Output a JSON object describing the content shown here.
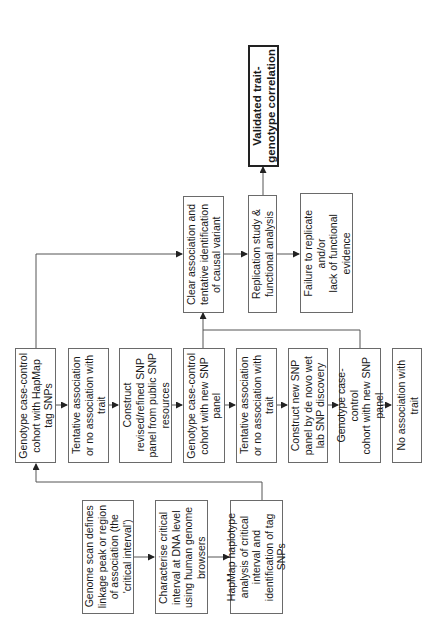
{
  "diagram": {
    "type": "flowchart",
    "orientation": "rotated-90-ccw",
    "colors": {
      "line": "#555555",
      "box_border": "#6a6a6a",
      "final_border": "#222222",
      "background": "#ffffff"
    },
    "nodes": {
      "genome_scan": "Genome scan defines\nlinkage peak or region\nof association (the\n'critical interval')",
      "characterise": "Characterise critical\ninterval at DNA level\nusing human genome\nbrowsers",
      "hapmap_analysis": "HapMap haplotype\nanalysis of critical\ninterval and\nidentification of tag\nSNPs",
      "genotype_hapmap": "Genotype case-control\ncohort with HapMap\ntag SNPs",
      "tentative_1": "Tentative association\nor no association with\ntrait",
      "construct_refined": "Construct\nrevised/refined SNP\npanel from public SNP\nresources",
      "genotype_new_1": "Genotype case-control\ncohort with new SNP\npanel",
      "tentative_2": "Tentative association\nor no association with\ntrait",
      "construct_denovo": "Construct new SNP\npanel by de novo wet\nlab SNP discovery",
      "genotype_new_2": "Genotype case-\ncontrol\ncohort with new SNP\npanel",
      "no_association": "No association with\ntrait",
      "clear_association": "Clear association and\ntentative identification\nof causal variant",
      "replication": "Replication study &\nfunctional analysis",
      "failure": "Failure to replicate\nand/or\nlack of functional\nevidence",
      "validated": "Validated trait-\ngenotype correlation"
    },
    "edges": [
      [
        "genome_scan",
        "characterise"
      ],
      [
        "characterise",
        "hapmap_analysis"
      ],
      [
        "hapmap_analysis",
        "genotype_hapmap"
      ],
      [
        "genotype_hapmap",
        "tentative_1"
      ],
      [
        "tentative_1",
        "construct_refined"
      ],
      [
        "construct_refined",
        "genotype_new_1"
      ],
      [
        "genotype_new_1",
        "tentative_2"
      ],
      [
        "tentative_2",
        "construct_denovo"
      ],
      [
        "construct_denovo",
        "genotype_new_2"
      ],
      [
        "genotype_new_2",
        "no_association"
      ],
      [
        "genotype_hapmap",
        "clear_association"
      ],
      [
        "genotype_new_1",
        "clear_association"
      ],
      [
        "genotype_new_2",
        "clear_association"
      ],
      [
        "clear_association",
        "replication"
      ],
      [
        "replication",
        "failure"
      ],
      [
        "replication",
        "validated"
      ]
    ]
  }
}
